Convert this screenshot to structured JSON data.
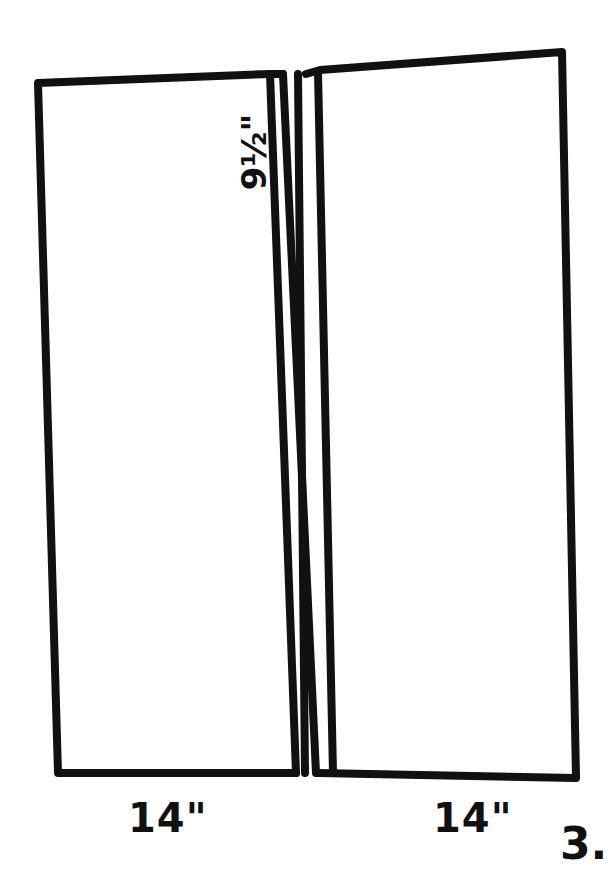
{
  "diagram": {
    "type": "sewing-pattern-sketch",
    "stroke_color": "#111111",
    "background": "#ffffff",
    "panels": [
      {
        "name": "left-panel",
        "width_label": "14\""
      },
      {
        "name": "right-panel",
        "width_label": "14\""
      }
    ],
    "center_strip": {
      "label": "9½\"",
      "line_count": 4
    }
  },
  "labels": {
    "left_width": "14\"",
    "right_width": "14\"",
    "strip_width": "9½\"",
    "step_number": "3."
  }
}
